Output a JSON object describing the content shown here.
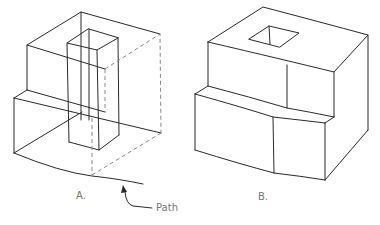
{
  "figure_a": {
    "label": "A.",
    "annotation": "Path"
  },
  "figure_b": {
    "label": "B."
  },
  "colors": {
    "line": "#2a2a2a",
    "hidden_line": "#8a8a8a",
    "label": "#777777",
    "background": "#ffffff"
  }
}
